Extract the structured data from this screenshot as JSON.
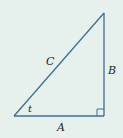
{
  "diagram": {
    "type": "right-triangle",
    "background": "#e6f1ee",
    "stroke_color": "#3f6f94",
    "labels": {
      "hypotenuse": "C",
      "vertical_leg": "B",
      "horizontal_leg": "A",
      "angle": "t"
    },
    "right_angle_marker": true
  }
}
